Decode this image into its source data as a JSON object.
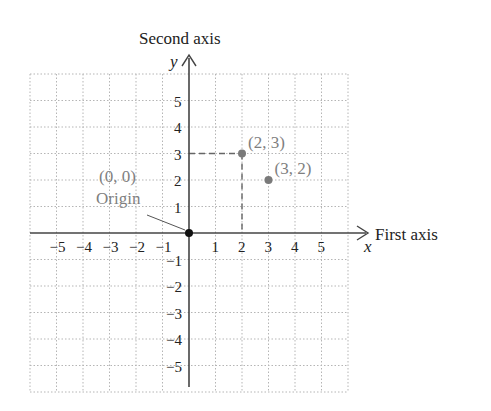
{
  "axes": {
    "y_axis_title": "Second axis",
    "y_symbol": "y",
    "x_axis_title": "First axis",
    "x_symbol": "x"
  },
  "ticks": {
    "x_positive": [
      "1",
      "2",
      "3",
      "4",
      "5"
    ],
    "x_negative": [
      "−5",
      "−4",
      "−3",
      "−2",
      "−1"
    ],
    "y_positive": [
      "1",
      "2",
      "3",
      "4",
      "5"
    ],
    "y_negative": [
      "−1",
      "−2",
      "−3",
      "−4",
      "−5"
    ]
  },
  "points": [
    {
      "label": "(2, 3)",
      "x": 2,
      "y": 3
    },
    {
      "label": "(3, 2)",
      "x": 3,
      "y": 2
    }
  ],
  "origin": {
    "coords_label": "(0, 0)",
    "name_label": "Origin"
  },
  "colors": {
    "axis": "#444444",
    "grid": "#b5b5b5",
    "point": "#7a7a7a",
    "origin_point": "#111111",
    "label_gray": "#7f7f7f",
    "text": "#222222"
  },
  "chart_data": {
    "type": "scatter",
    "title": "",
    "xlabel": "First axis (x)",
    "ylabel": "Second axis (y)",
    "xlim": [
      -6,
      6
    ],
    "ylim": [
      -6,
      6
    ],
    "grid": true,
    "series": [
      {
        "name": "points",
        "x": [
          0,
          2,
          3
        ],
        "y": [
          0,
          3,
          2
        ],
        "labels": [
          "(0, 0) Origin",
          "(2, 3)",
          "(3, 2)"
        ]
      }
    ],
    "annotations": [
      "Dashed projection lines from (2, 3) to x=2 and y=3"
    ]
  }
}
